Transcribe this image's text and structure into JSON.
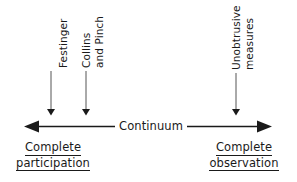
{
  "diagram": {
    "axis": {
      "label": "Continuum",
      "left_arrow": "left-arrowhead",
      "right_arrow": "right-arrowhead"
    },
    "endpoints": [
      {
        "id": "left",
        "lines": [
          "Complete",
          "participation"
        ]
      },
      {
        "id": "right",
        "lines": [
          "Complete",
          "observation"
        ]
      }
    ],
    "markers": [
      {
        "id": "festinger",
        "lines": [
          "Festinger"
        ],
        "x": 51
      },
      {
        "id": "collins-and-pinch",
        "lines": [
          "Collins",
          "and Pinch"
        ],
        "x": 86
      },
      {
        "id": "unobtrusive-measures",
        "lines": [
          "Unobtrusive",
          "measures"
        ],
        "x": 236
      }
    ],
    "colors": {
      "ink": "#1a1a1a",
      "line": "#555555",
      "background": "#ffffff"
    }
  }
}
